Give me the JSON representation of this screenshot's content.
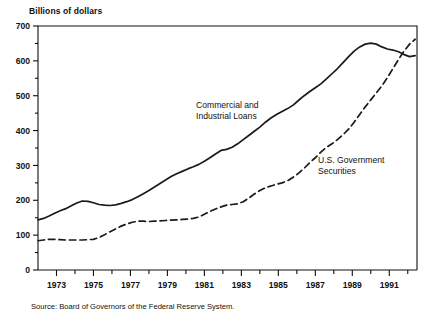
{
  "chart_data": {
    "type": "line",
    "title": "",
    "ylabel": "Billions of dollars",
    "xlabel": "",
    "ylim": [
      0,
      700
    ],
    "xlim": [
      1972.0,
      1992.5
    ],
    "grid": false,
    "legend_position": "inline-annotation",
    "y_ticks_major": [
      0,
      100,
      200,
      300,
      400,
      500,
      600,
      700
    ],
    "y_ticks_minor": [
      50,
      150,
      250,
      350,
      450,
      550,
      650
    ],
    "y_tick_labels": [
      "0",
      "100",
      "200",
      "300",
      "400",
      "500",
      "600",
      "700"
    ],
    "x_ticks_major": [
      1973,
      1975,
      1977,
      1979,
      1981,
      1983,
      1985,
      1987,
      1989,
      1991
    ],
    "x_tick_labels": [
      "1973",
      "1975",
      "1977",
      "1979",
      "1981",
      "1983",
      "1985",
      "1987",
      "1989",
      "1991"
    ],
    "x_ticks_minor": [
      1974,
      1976,
      1978,
      1980,
      1982,
      1984,
      1986,
      1988,
      1990,
      1992
    ],
    "source": "Source: Board of Governors of the Federal Reserve System.",
    "series": [
      {
        "name": "Commercial and Industrial Loans",
        "style": "solid",
        "color": "#1a1a1a",
        "label_line_1": "Commercial and",
        "label_line_2": "Industrial Loans",
        "x": [
          1972.0,
          1972.3,
          1972.6,
          1972.9,
          1973.2,
          1973.5,
          1973.8,
          1974.1,
          1974.4,
          1974.7,
          1975.0,
          1975.3,
          1975.6,
          1975.9,
          1976.2,
          1976.5,
          1976.8,
          1977.1,
          1977.4,
          1977.7,
          1978.0,
          1978.3,
          1978.6,
          1978.9,
          1979.2,
          1979.5,
          1979.8,
          1980.1,
          1980.4,
          1980.7,
          1981.0,
          1981.3,
          1981.6,
          1981.9,
          1982.2,
          1982.5,
          1982.8,
          1983.1,
          1983.4,
          1983.7,
          1984.0,
          1984.3,
          1984.6,
          1984.9,
          1985.2,
          1985.5,
          1985.8,
          1986.1,
          1986.4,
          1986.7,
          1987.0,
          1987.3,
          1987.6,
          1987.9,
          1988.2,
          1988.5,
          1988.8,
          1989.1,
          1989.4,
          1989.7,
          1990.0,
          1990.3,
          1990.6,
          1990.9,
          1991.2,
          1991.5,
          1991.8,
          1992.1,
          1992.4
        ],
        "y": [
          144,
          148,
          155,
          163,
          170,
          176,
          184,
          192,
          198,
          197,
          193,
          188,
          186,
          185,
          187,
          191,
          196,
          202,
          210,
          219,
          228,
          238,
          248,
          258,
          268,
          276,
          283,
          290,
          296,
          303,
          312,
          322,
          333,
          343,
          346,
          352,
          362,
          374,
          386,
          398,
          410,
          424,
          436,
          446,
          455,
          463,
          473,
          487,
          500,
          512,
          523,
          534,
          548,
          563,
          578,
          595,
          612,
          628,
          640,
          648,
          651,
          648,
          640,
          634,
          631,
          626,
          618,
          612,
          615
        ]
      },
      {
        "name": "U.S. Government Securities",
        "style": "dashed",
        "color": "#1a1a1a",
        "label_line_1": "U.S. Government",
        "label_line_2": "Securities",
        "x": [
          1972.0,
          1972.3,
          1972.6,
          1972.9,
          1973.2,
          1973.5,
          1973.8,
          1974.1,
          1974.4,
          1974.7,
          1975.0,
          1975.3,
          1975.6,
          1975.9,
          1976.2,
          1976.5,
          1976.8,
          1977.1,
          1977.4,
          1977.7,
          1978.0,
          1978.3,
          1978.6,
          1978.9,
          1979.2,
          1979.5,
          1979.8,
          1980.1,
          1980.4,
          1980.7,
          1981.0,
          1981.3,
          1981.6,
          1981.9,
          1982.2,
          1982.5,
          1982.8,
          1983.1,
          1983.4,
          1983.7,
          1984.0,
          1984.3,
          1984.6,
          1984.9,
          1985.2,
          1985.5,
          1985.8,
          1986.1,
          1986.4,
          1986.7,
          1987.0,
          1987.3,
          1987.6,
          1987.9,
          1988.2,
          1988.5,
          1988.8,
          1989.1,
          1989.4,
          1989.7,
          1990.0,
          1990.3,
          1990.6,
          1990.9,
          1991.2,
          1991.5,
          1991.8,
          1992.1,
          1992.4
        ],
        "y": [
          84,
          86,
          88,
          88,
          87,
          86,
          86,
          86,
          86,
          87,
          88,
          93,
          101,
          110,
          118,
          126,
          132,
          137,
          140,
          140,
          139,
          140,
          141,
          142,
          143,
          144,
          145,
          146,
          148,
          152,
          160,
          168,
          175,
          181,
          186,
          188,
          190,
          196,
          206,
          218,
          228,
          236,
          241,
          246,
          250,
          256,
          266,
          278,
          292,
          308,
          322,
          338,
          352,
          362,
          374,
          388,
          404,
          424,
          446,
          468,
          488,
          508,
          528,
          552,
          578,
          604,
          628,
          648,
          662
        ]
      }
    ]
  }
}
